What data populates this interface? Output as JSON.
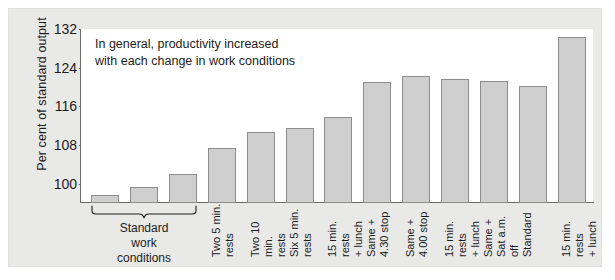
{
  "figure": {
    "annotation_line1": "In general, productivity increased",
    "annotation_line2": "with each change in work conditions",
    "group_caption_line1": "Standard",
    "group_caption_line2": "work",
    "group_caption_line3": "conditions",
    "panel_bg": "#e9e9e8",
    "plot_bg": "#ffffff",
    "bar_fill": "#cfcfcf",
    "bar_stroke": "#8d8d8d",
    "axis_color": "#6a6a6a",
    "text_color": "#1c1c1c"
  },
  "chart_data": {
    "type": "bar",
    "title": "",
    "xlabel": "",
    "ylabel": "Per cent of standard output",
    "ylim": [
      96,
      132
    ],
    "yticks": [
      100,
      108,
      116,
      124,
      132
    ],
    "grid": false,
    "legend": false,
    "annotation": "In general, productivity increased with each change in work conditions",
    "group_bracket": {
      "label": "Standard work conditions",
      "covers_categories": [
        0,
        1,
        2
      ]
    },
    "categories": [
      "Standard work conditions",
      "Standard work conditions",
      "Standard work conditions",
      "Two 5 min. rests",
      "Two 10 min. rests",
      "Six 5 min. rests",
      "15 min. rests + lunch",
      "Same + 4.30 stop",
      "Same + 4.00 stop",
      "15 min. rests + lunch",
      "Same + Sat a.m. off",
      "Standard",
      "15 min. rests + lunch"
    ],
    "tick_labels": [
      "",
      "",
      "",
      "Two 5 min.\nrests",
      "Two 10 min.\nrests",
      "Six 5 min.\nrests",
      "15 min. rests\n+ lunch",
      "Same +\n4.30 stop",
      "Same +\n4.00 stop",
      "15 min. rests\n+ lunch",
      "Same +\nSat a.m. off",
      "Standard",
      "15 min. rests\n+ lunch"
    ],
    "values": [
      97.7,
      99.4,
      102.1,
      107.4,
      110.6,
      111.6,
      113.8,
      121.1,
      122.3,
      121.6,
      121.3,
      120.2,
      130.3
    ]
  }
}
